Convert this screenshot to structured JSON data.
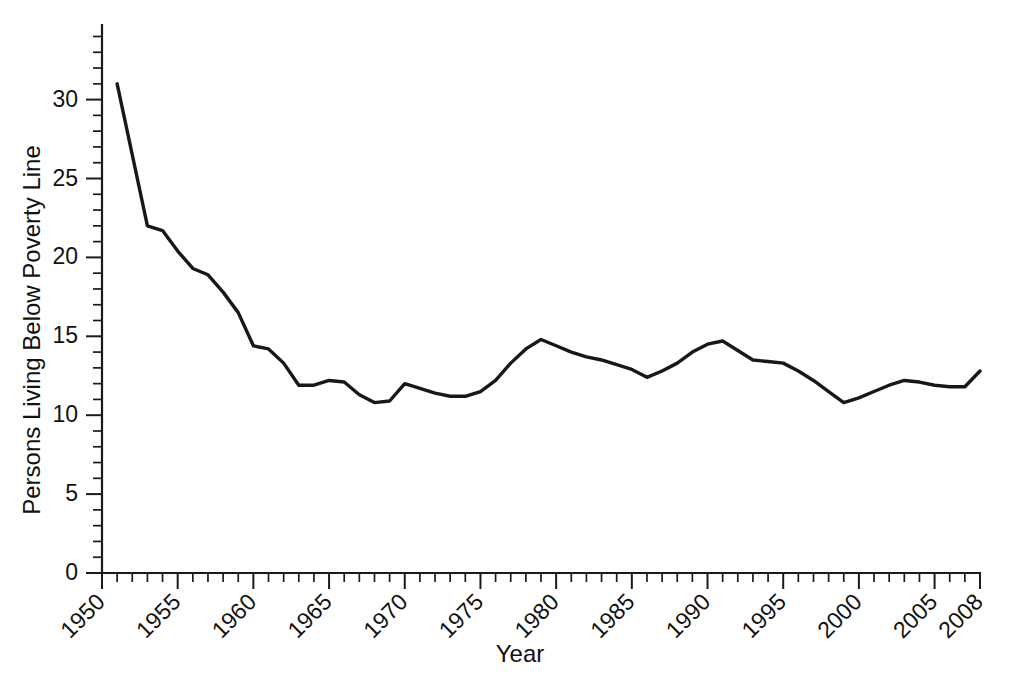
{
  "chart_data": {
    "type": "line",
    "title": "",
    "xlabel": "Year",
    "ylabel": "Persons Living Below Poverty Line",
    "xlim": [
      1950,
      2008
    ],
    "ylim": [
      0,
      34
    ],
    "grid": false,
    "legend": null,
    "line_color": "#181818",
    "background_color": "#ffffff",
    "axis_color": "#1a1a1a",
    "y_major_ticks": [
      0,
      5,
      10,
      15,
      20,
      25,
      30
    ],
    "y_tick_labels": [
      "0",
      "5",
      "10",
      "15",
      "20",
      "25",
      "30"
    ],
    "y_minor_tick_step": 1,
    "x_major_ticks": [
      1950,
      1955,
      1960,
      1965,
      1970,
      1975,
      1980,
      1985,
      1990,
      1995,
      2000,
      2005,
      2008
    ],
    "x_tick_labels": [
      "1950",
      "1955",
      "1960",
      "1965",
      "1970",
      "1975",
      "1980",
      "1985",
      "1990",
      "1995",
      "2000",
      "2005",
      "2008"
    ],
    "x_minor_tick_step": 1,
    "x": [
      1951,
      1952,
      1953,
      1954,
      1955,
      1956,
      1957,
      1958,
      1959,
      1960,
      1961,
      1962,
      1963,
      1964,
      1965,
      1966,
      1967,
      1968,
      1969,
      1970,
      1971,
      1972,
      1973,
      1974,
      1975,
      1976,
      1977,
      1978,
      1979,
      1980,
      1981,
      1982,
      1983,
      1984,
      1985,
      1986,
      1987,
      1988,
      1989,
      1990,
      1991,
      1992,
      1993,
      1994,
      1995,
      1996,
      1997,
      1998,
      1999,
      2000,
      2001,
      2002,
      2003,
      2004,
      2005,
      2006,
      2007,
      2008
    ],
    "y": [
      31.0,
      26.5,
      22.0,
      21.7,
      20.4,
      19.3,
      18.9,
      17.8,
      16.5,
      14.4,
      14.2,
      13.3,
      11.9,
      11.9,
      12.2,
      12.1,
      11.3,
      10.8,
      10.9,
      12.0,
      11.7,
      11.4,
      11.2,
      11.2,
      11.5,
      12.2,
      13.3,
      14.2,
      14.8,
      14.4,
      14.0,
      13.7,
      13.5,
      13.2,
      12.9,
      12.4,
      12.8,
      13.3,
      14.0,
      14.5,
      14.7,
      14.1,
      13.5,
      13.4,
      13.3,
      12.8,
      12.2,
      11.5,
      10.8,
      11.1,
      11.5,
      11.9,
      12.2,
      12.1,
      11.9,
      11.8,
      11.8,
      12.8
    ],
    "series_name": "Percent of persons living below poverty line",
    "data_point_count": 58,
    "y_first": 31.0,
    "y_last": 12.8,
    "y_min": 10.8,
    "y_max": 31.0
  }
}
